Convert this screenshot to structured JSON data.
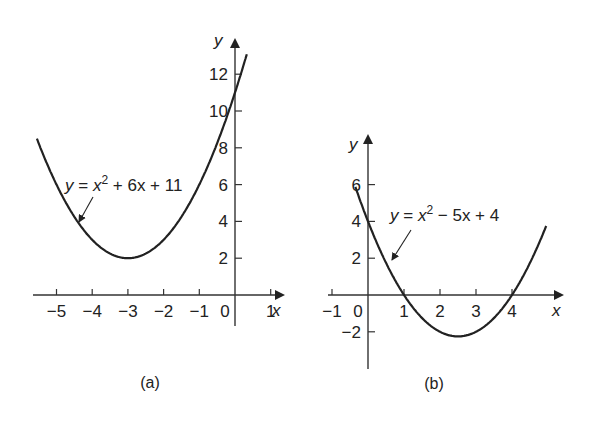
{
  "chart_data": [
    {
      "type": "line",
      "caption": "(a)",
      "equation": "y = x² + 6x + 11",
      "equation_parts": {
        "lhs": "y",
        "eq": " = ",
        "x": "x",
        "exp": "2",
        "rest": " + 6x + 11"
      },
      "xlabel": "x",
      "ylabel": "y",
      "xticks": [
        "−5",
        "−4",
        "−3",
        "−2",
        "−1",
        "0",
        "1"
      ],
      "yticks": [
        "2",
        "4",
        "6",
        "8",
        "10",
        "12"
      ],
      "xlim": [
        -5.6,
        1.4
      ],
      "ylim": [
        -1.5,
        13.5
      ],
      "grid": false,
      "x": [
        -5.5,
        -5,
        -4.5,
        -4,
        -3.5,
        -3,
        -2.5,
        -2,
        -1.5,
        -1,
        -0.5,
        0,
        0.3
      ],
      "values": [
        8.25,
        6,
        4.25,
        3,
        2.25,
        2,
        2.25,
        3,
        4.25,
        6,
        8.25,
        11,
        12.89
      ],
      "vertex": [
        -3,
        2
      ]
    },
    {
      "type": "line",
      "caption": "(b)",
      "equation": "y = x² − 5x + 4",
      "equation_parts": {
        "lhs": "y",
        "eq": " = ",
        "x": "x",
        "exp": "2",
        "rest": " − 5x + 4"
      },
      "xlabel": "x",
      "ylabel": "y",
      "xticks": [
        "−1",
        "0",
        "1",
        "2",
        "3",
        "4"
      ],
      "yticks": [
        "−2",
        "2",
        "4",
        "6"
      ],
      "xlim": [
        -1.2,
        5.5
      ],
      "ylim": [
        -3.5,
        7.5
      ],
      "grid": false,
      "x": [
        -0.4,
        0,
        0.5,
        1,
        1.5,
        2,
        2.5,
        3,
        3.5,
        4,
        4.5,
        5
      ],
      "values": [
        6.16,
        4,
        1.75,
        0,
        -1.25,
        -2,
        -2.25,
        -2,
        -1.25,
        0,
        1.75,
        4
      ],
      "vertex": [
        2.5,
        -2.25
      ],
      "roots": [
        1,
        4
      ]
    }
  ]
}
